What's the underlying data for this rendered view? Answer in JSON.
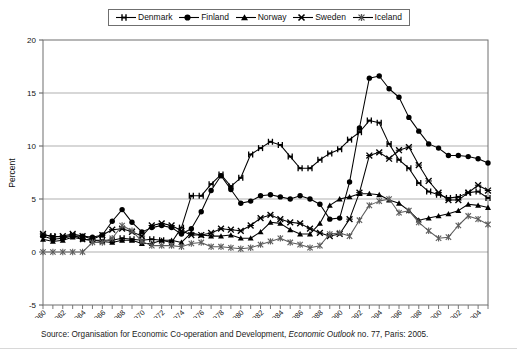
{
  "chart_data": {
    "type": "line",
    "title": "",
    "xlabel": "",
    "ylabel": "Percent",
    "ylim": [
      -5,
      20
    ],
    "yticks": [
      -5,
      0,
      5,
      10,
      15,
      20
    ],
    "xlim": [
      1960,
      2005
    ],
    "xticks": [
      1960,
      1961,
      1962,
      1963,
      1964,
      1965,
      1966,
      1967,
      1968,
      1969,
      1970,
      1971,
      1972,
      1973,
      1974,
      1975,
      1976,
      1977,
      1978,
      1979,
      1980,
      1981,
      1982,
      1983,
      1984,
      1985,
      1986,
      1987,
      1988,
      1989,
      1990,
      1991,
      1992,
      1993,
      1994,
      1995,
      1996,
      1997,
      1998,
      1999,
      2000,
      2001,
      2002,
      2003,
      2004,
      2005
    ],
    "xtick_labels": [
      "1960",
      "1962",
      "1964",
      "1966",
      "1968",
      "1970",
      "1972",
      "1974",
      "1976",
      "1978",
      "1980",
      "1982",
      "1984",
      "1986",
      "1988",
      "1990",
      "1992",
      "1994",
      "1996",
      "1998",
      "2000",
      "2002",
      "2004"
    ],
    "grid": "horizontal",
    "legend_position": "top",
    "x": [
      1960,
      1961,
      1962,
      1963,
      1964,
      1965,
      1966,
      1967,
      1968,
      1969,
      1970,
      1971,
      1972,
      1973,
      1974,
      1975,
      1976,
      1977,
      1978,
      1979,
      1980,
      1981,
      1982,
      1983,
      1984,
      1985,
      1986,
      1987,
      1988,
      1989,
      1990,
      1991,
      1992,
      1993,
      1994,
      1995,
      1996,
      1997,
      1998,
      1999,
      2000,
      2001,
      2002,
      2003,
      2004,
      2005
    ],
    "series": [
      {
        "name": "Denmark",
        "marker": "plus",
        "values": [
          1.6,
          1.5,
          1.4,
          1.6,
          1.2,
          1.1,
          1.1,
          1.1,
          1.3,
          1.2,
          1.1,
          1.2,
          1.1,
          0.9,
          2.3,
          5.3,
          5.3,
          6.4,
          7.3,
          6.2,
          7.0,
          9.2,
          9.8,
          10.4,
          10.1,
          9.0,
          7.9,
          7.9,
          8.7,
          9.3,
          9.7,
          10.6,
          11.3,
          12.4,
          12.2,
          10.2,
          8.7,
          7.9,
          6.5,
          5.7,
          5.4,
          5.1,
          5.2,
          5.6,
          5.7,
          5.1
        ]
      },
      {
        "name": "Finland",
        "marker": "circle",
        "values": [
          1.5,
          1.2,
          1.3,
          1.5,
          1.5,
          1.4,
          1.6,
          2.9,
          4.0,
          2.8,
          1.9,
          2.3,
          2.5,
          2.3,
          1.7,
          2.2,
          3.8,
          5.8,
          7.2,
          5.9,
          4.6,
          4.8,
          5.3,
          5.4,
          5.2,
          5.0,
          5.3,
          5.0,
          4.5,
          3.1,
          3.2,
          6.6,
          11.7,
          16.4,
          16.6,
          15.4,
          14.6,
          12.7,
          11.4,
          10.2,
          9.8,
          9.1,
          9.1,
          9.0,
          8.8,
          8.4
        ]
      },
      {
        "name": "Norway",
        "marker": "triangle",
        "values": [
          1.2,
          1.0,
          1.1,
          1.4,
          1.2,
          1.1,
          1.0,
          0.9,
          1.1,
          1.1,
          0.8,
          0.8,
          1.1,
          1.1,
          0.9,
          1.8,
          1.6,
          1.5,
          1.5,
          1.6,
          1.3,
          1.3,
          1.9,
          2.8,
          2.7,
          2.1,
          1.7,
          1.7,
          2.7,
          4.4,
          5.0,
          5.2,
          5.5,
          5.5,
          5.4,
          4.9,
          4.6,
          3.9,
          3.0,
          3.2,
          3.4,
          3.6,
          3.9,
          4.5,
          4.4,
          4.2
        ]
      },
      {
        "name": "Sweden",
        "marker": "x",
        "values": [
          1.7,
          1.4,
          1.5,
          1.7,
          1.5,
          1.2,
          1.6,
          2.1,
          2.2,
          1.9,
          1.5,
          2.5,
          2.7,
          2.5,
          2.0,
          1.6,
          1.6,
          1.8,
          2.2,
          2.1,
          2.0,
          2.5,
          3.2,
          3.5,
          3.1,
          2.8,
          2.7,
          2.2,
          1.8,
          1.5,
          1.7,
          3.1,
          5.6,
          9.1,
          9.4,
          8.8,
          9.6,
          9.9,
          8.2,
          6.7,
          5.6,
          4.9,
          4.9,
          5.6,
          6.3,
          5.8
        ]
      },
      {
        "name": "Iceland",
        "marker": "asterisk",
        "values": [
          0.0,
          0.0,
          0.0,
          0.0,
          0.0,
          0.9,
          0.9,
          1.3,
          2.5,
          2.0,
          1.0,
          0.6,
          0.6,
          0.6,
          0.5,
          0.8,
          0.9,
          0.5,
          0.5,
          0.4,
          0.3,
          0.4,
          0.7,
          1.0,
          1.3,
          0.9,
          0.7,
          0.4,
          0.6,
          1.7,
          1.8,
          1.5,
          3.0,
          4.4,
          4.8,
          5.0,
          3.7,
          3.9,
          2.8,
          2.0,
          1.3,
          1.4,
          2.5,
          3.4,
          3.1,
          2.6
        ]
      }
    ]
  },
  "legend": {
    "items": [
      {
        "label": "Denmark",
        "marker": "plus"
      },
      {
        "label": "Finland",
        "marker": "circle"
      },
      {
        "label": "Norway",
        "marker": "triangle"
      },
      {
        "label": "Sweden",
        "marker": "x"
      },
      {
        "label": "Iceland",
        "marker": "asterisk"
      }
    ]
  },
  "axis": {
    "ylabel": "Percent"
  },
  "source": {
    "prefix": "Source: Organisation for Economic Co-operation and Development, ",
    "italic": "Economic Outlook",
    "suffix": " no. 77, Paris: 2005."
  }
}
